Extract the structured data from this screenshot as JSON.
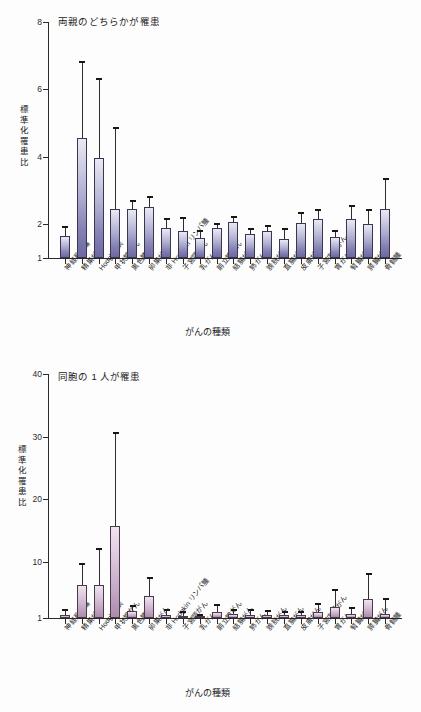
{
  "figure": {
    "background_color": "#fdfdfd",
    "bar_color_top": "#8682b4",
    "bar_color_bottom": "#bb9dbb",
    "axis_color": "#2a2a2a"
  },
  "chart_data": [
    {
      "type": "bar",
      "title": "両親のどちらかが罹患",
      "xlabel": "がんの種類",
      "ylabel": "標準化罹患比",
      "ylim": [
        1,
        8
      ],
      "yticks": [
        1,
        2,
        4,
        6,
        8
      ],
      "ytick_labels": [
        "1",
        "2",
        "4",
        "6",
        "8"
      ],
      "grid": false,
      "legend": "none",
      "categories": [
        "神経系腫瘍",
        "精巣がん",
        "Hodgkin 病",
        "甲状腺がん",
        "黒色腫",
        "卵巣がん",
        "非 Hodgkin リンパ腫",
        "子宮頸がん",
        "乳がん",
        "前立腺がん",
        "結腸がん",
        "肺がん",
        "膀胱がん",
        "直腸がん",
        "皮膚がん",
        "子宮内膜がん",
        "胃がん",
        "腎臓がん",
        "膵臓がん",
        "骨髄腫"
      ],
      "values": [
        1.65,
        4.55,
        3.98,
        2.45,
        2.45,
        2.52,
        1.89,
        1.79,
        1.6,
        1.88,
        2.08,
        1.7,
        1.79,
        1.56,
        2.05,
        2.17,
        1.63,
        2.17,
        2.02,
        2.45
      ],
      "error_upper": [
        1.92,
        6.8,
        6.32,
        4.86,
        2.68,
        2.82,
        2.17,
        2.18,
        1.8,
        2.0,
        2.22,
        1.85,
        1.95,
        1.87,
        2.34,
        2.42,
        1.8,
        2.55,
        2.42,
        3.35
      ]
    },
    {
      "type": "bar",
      "title": "同胞の 1 人が罹患",
      "xlabel": "がんの種類",
      "ylabel": "標準化罹患比",
      "ylim": [
        1,
        40
      ],
      "yticks": [
        1,
        10,
        20,
        30,
        40
      ],
      "ytick_labels": [
        "1",
        "10",
        "20",
        "30",
        "40"
      ],
      "grid": false,
      "legend": "none",
      "categories": [
        "神経系腫瘍",
        "精巣がん",
        "Hodgkin 病",
        "甲状腺がん",
        "黒色腫",
        "卵巣がん",
        "非 Hodgkin リンパ腫",
        "子宮頸がん",
        "乳がん",
        "前立腺がん",
        "結腸がん",
        "肺がん",
        "膀胱がん",
        "直腸がん",
        "皮膚がん",
        "子宮内膜がん",
        "胃がん",
        "腎臓がん",
        "膵臓がん",
        "骨髄腫"
      ],
      "values": [
        1.55,
        6.3,
        6.2,
        15.7,
        2.1,
        4.5,
        1.55,
        1.35,
        1.25,
        1.95,
        1.6,
        1.55,
        1.5,
        1.45,
        1.5,
        1.95,
        2.7,
        1.6,
        4.0,
        1.6
      ],
      "error_upper": [
        2.3,
        9.7,
        12.0,
        30.6,
        2.9,
        7.4,
        2.3,
        1.9,
        1.55,
        3.0,
        2.3,
        2.2,
        2.05,
        1.95,
        2.0,
        3.2,
        5.4,
        2.55,
        8.0,
        4.0
      ]
    }
  ]
}
